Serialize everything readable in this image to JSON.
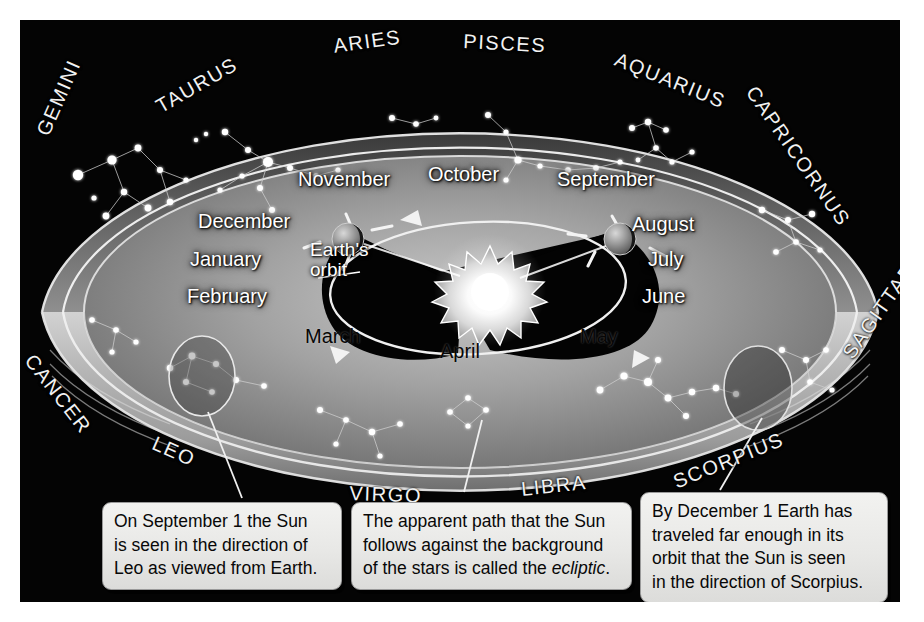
{
  "figure": {
    "frame_color": "#040404",
    "background_color": "#ffffff"
  },
  "zodiac_labels": [
    {
      "name": "GEMINI",
      "text": "GEMINI"
    },
    {
      "name": "TAURUS",
      "text": "TAURUS"
    },
    {
      "name": "ARIES",
      "text": "ARIES"
    },
    {
      "name": "PISCES",
      "text": "PISCES"
    },
    {
      "name": "AQUARIUS",
      "text": "AQUARIUS"
    },
    {
      "name": "CAPRICORNUS",
      "text": "CAPRICORNUS"
    },
    {
      "name": "SAGITTARIUS",
      "text": "SAGITTARIUS"
    },
    {
      "name": "SCORPIUS",
      "text": "SCORPIUS"
    },
    {
      "name": "LIBRA",
      "text": "LIBRA"
    },
    {
      "name": "VIRGO",
      "text": "VIRGO"
    },
    {
      "name": "LEO",
      "text": "LEO"
    },
    {
      "name": "CANCER",
      "text": "CANCER"
    }
  ],
  "months": {
    "september": "September",
    "october": "October",
    "november": "November",
    "december": "December",
    "january": "January",
    "february": "February",
    "march": "March",
    "april": "April",
    "may": "May",
    "june": "June",
    "july": "July",
    "august": "August"
  },
  "annotations": {
    "earth_orbit_line1": "Earth's",
    "earth_orbit_line2": "orbit"
  },
  "captions": {
    "left": {
      "name": "caption-september",
      "line1": "On September 1 the Sun",
      "line2": "is seen in the direction of",
      "line3": "Leo as viewed from Earth."
    },
    "middle": {
      "name": "caption-ecliptic",
      "line1": "The apparent path that the Sun",
      "line2": "follows against the background",
      "line3_before": "of the stars is called the ",
      "line3_em": "ecliptic",
      "line3_after": "."
    },
    "right": {
      "name": "caption-december",
      "line1": "By December 1 Earth has",
      "line2": "traveled far enough in its",
      "line3": "orbit that the Sun is seen",
      "line4": "in the direction of Scorpius."
    }
  },
  "objects": {
    "sun": "sun",
    "earth_september": "earth-september",
    "earth_december": "earth-december",
    "leo_highlight": "leo-highlight-ellipse",
    "scorpius_highlight": "scorpius-highlight-ellipse"
  },
  "colors": {
    "band_light": "#b9b9b9",
    "band_mid": "#8e8e8e",
    "band_dark": "#4a4a4a",
    "star_white": "#ffffff",
    "sun_core": "#ffffff",
    "panel_black": "#040404",
    "caption_bg": "#ececea"
  }
}
